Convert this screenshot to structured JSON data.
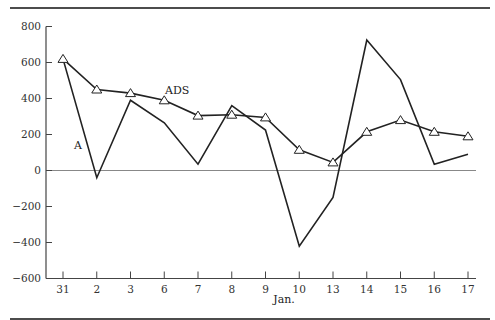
{
  "chart_data": {
    "type": "line",
    "title": "",
    "xlabel": "Jan.",
    "ylabel": "",
    "categories": [
      "31",
      "2",
      "3",
      "6",
      "7",
      "8",
      "9",
      "10",
      "13",
      "14",
      "15",
      "16",
      "17"
    ],
    "ylim": [
      -600,
      800
    ],
    "yticks": [
      800,
      600,
      400,
      200,
      0,
      -200,
      -400,
      -600
    ],
    "ytick_labels": [
      "800",
      "600",
      "400",
      "200",
      "0",
      "−200",
      "−400",
      "−600"
    ],
    "grid": false,
    "zero_line": true,
    "series": [
      {
        "name": "A",
        "label": "A",
        "marker": "none",
        "values": [
          620,
          -40,
          390,
          265,
          35,
          360,
          225,
          -420,
          -150,
          725,
          505,
          35,
          90
        ]
      },
      {
        "name": "ADS",
        "label": "ADS",
        "marker": "triangle",
        "values": [
          620,
          450,
          430,
          390,
          305,
          310,
          295,
          115,
          45,
          215,
          280,
          215,
          190
        ]
      }
    ],
    "colors": {
      "line": "#222222",
      "axis": "#444444",
      "zero_line": "#888888",
      "rule": "#111111"
    }
  }
}
